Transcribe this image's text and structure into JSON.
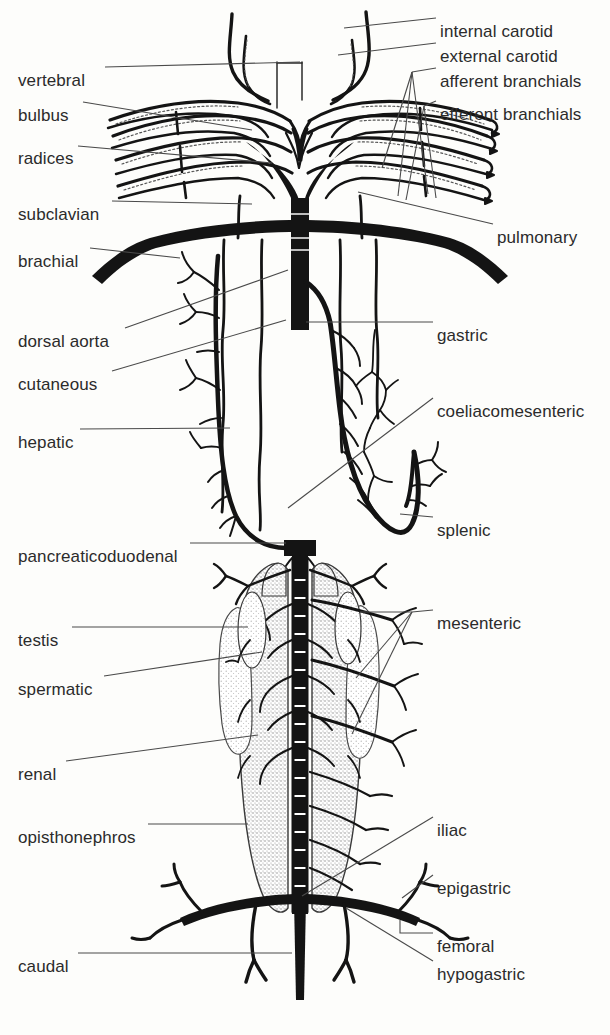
{
  "figure": {
    "ink_color": "#111111",
    "line_color": "#4a4a4a",
    "text_color": "#2b2b2b",
    "background_color": "#fdfdfb",
    "stipple_color": "#8a8a8a"
  },
  "labels_left": [
    {
      "id": "vertebral",
      "text": "vertebral",
      "x": 18,
      "y": 72,
      "leader_to_x": 300,
      "leader_to_y": 64
    },
    {
      "id": "bulbus",
      "text": "bulbus",
      "x": 18,
      "y": 107,
      "leader_to_x": 252,
      "leader_to_y": 130
    },
    {
      "id": "radices",
      "text": "radices",
      "x": 18,
      "y": 150,
      "leader_to_x": 270,
      "leader_to_y": 162
    },
    {
      "id": "subclavian",
      "text": "subclavian",
      "x": 18,
      "y": 206,
      "leader_to_x": 250,
      "leader_to_y": 204
    },
    {
      "id": "brachial",
      "text": "brachial",
      "x": 18,
      "y": 253,
      "leader_to_x": 175,
      "leader_to_y": 262
    },
    {
      "id": "dorsal-aorta",
      "text": "dorsal aorta",
      "x": 18,
      "y": 333,
      "leader_to_x": 288,
      "leader_to_y": 272
    },
    {
      "id": "cutaneous",
      "text": "cutaneous",
      "x": 18,
      "y": 376,
      "leader_to_x": 285,
      "leader_to_y": 322
    },
    {
      "id": "hepatic",
      "text": "hepatic",
      "x": 18,
      "y": 434,
      "leader_to_x": 237,
      "leader_to_y": 428
    },
    {
      "id": "pancreaticoduodenal",
      "text": "pancreaticoduodenal",
      "x": 18,
      "y": 548,
      "leader_to_x": 285,
      "leader_to_y": 545
    },
    {
      "id": "testis",
      "text": "testis",
      "x": 18,
      "y": 632,
      "leader_to_x": 245,
      "leader_to_y": 632
    },
    {
      "id": "spermatic",
      "text": "spermatic",
      "x": 18,
      "y": 681,
      "leader_to_x": 262,
      "leader_to_y": 655
    },
    {
      "id": "renal",
      "text": "renal",
      "x": 18,
      "y": 766,
      "leader_to_x": 255,
      "leader_to_y": 737
    },
    {
      "id": "opisthonephros",
      "text": "opisthonephros",
      "x": 18,
      "y": 829,
      "leader_to_x": 248,
      "leader_to_y": 829
    },
    {
      "id": "caudal",
      "text": "caudal",
      "x": 18,
      "y": 958,
      "leader_to_x": 290,
      "leader_to_y": 958
    }
  ],
  "labels_right": [
    {
      "id": "internal-carotid",
      "text": "internal carotid",
      "x": 440,
      "y": 23,
      "leader_to_x": 345,
      "leader_to_y": 30
    },
    {
      "id": "external-carotid",
      "text": "external carotid",
      "x": 440,
      "y": 48,
      "leader_to_x": 340,
      "leader_to_y": 57
    },
    {
      "id": "afferent-branchials",
      "text": "afferent branchials",
      "x": 440,
      "y": 73,
      "leader_to_x": 418,
      "leader_to_y": 77
    },
    {
      "id": "efferent-branchials",
      "text": "efferent branchials",
      "x": 440,
      "y": 106,
      "leader_to_x": 430,
      "leader_to_y": 110
    },
    {
      "id": "pulmonary",
      "text": "pulmonary",
      "x": 497,
      "y": 229,
      "leader_to_x": 358,
      "leader_to_y": 196
    },
    {
      "id": "gastric",
      "text": "gastric",
      "x": 437,
      "y": 327,
      "leader_to_x": 310,
      "leader_to_y": 325
    },
    {
      "id": "coeliacomesenteric",
      "text": "coeliacomesenteric",
      "x": 437,
      "y": 403,
      "leader_to_x": 288,
      "leader_to_y": 505
    },
    {
      "id": "splenic",
      "text": "splenic",
      "x": 437,
      "y": 522,
      "leader_to_x": 380,
      "leader_to_y": 519
    },
    {
      "id": "mesenteric",
      "text": "mesenteric",
      "x": 437,
      "y": 615,
      "leader_to_x": 418,
      "leader_to_y": 618
    },
    {
      "id": "iliac",
      "text": "iliac",
      "x": 437,
      "y": 822,
      "leader_to_x": 300,
      "leader_to_y": 898
    },
    {
      "id": "epigastric",
      "text": "epigastric",
      "x": 437,
      "y": 880,
      "leader_to_x": 392,
      "leader_to_y": 902
    },
    {
      "id": "femoral",
      "text": "femoral",
      "x": 437,
      "y": 938,
      "leader_to_x": 398,
      "leader_to_y": 921
    },
    {
      "id": "hypogastric",
      "text": "hypogastric",
      "x": 437,
      "y": 966,
      "leader_to_x": 346,
      "leader_to_y": 912
    }
  ]
}
